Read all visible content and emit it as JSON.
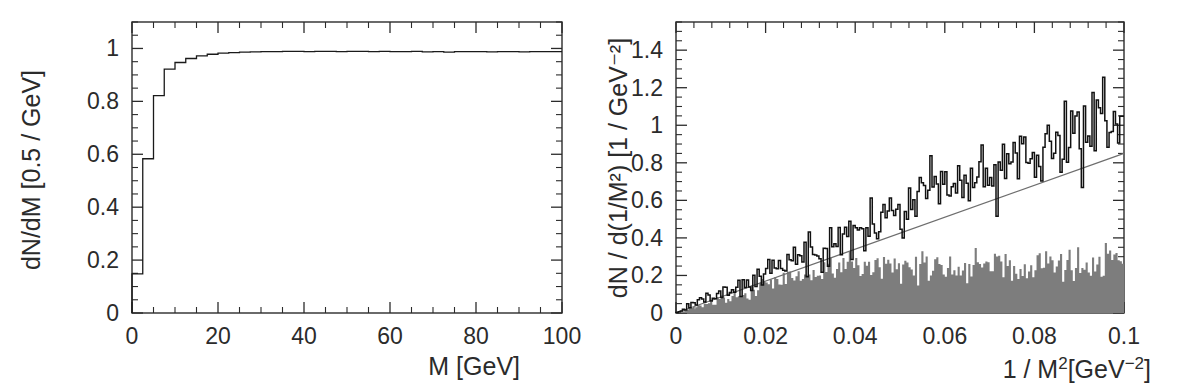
{
  "figure": {
    "panels": [
      "left",
      "right"
    ],
    "background": "#ffffff",
    "ink_color": "#2b2b2b",
    "gray_fill_color": "#7d7d7d",
    "fit_line_color": "#6e6e6e"
  },
  "chart_data": [
    {
      "panel": "left",
      "type": "line",
      "title": "",
      "xlabel": "M [GeV]",
      "ylabel": "dN/dM [0.5 / GeV]",
      "xlim": [
        0,
        100
      ],
      "ylim": [
        0,
        1.1
      ],
      "xticks": [
        0,
        20,
        40,
        60,
        80,
        100
      ],
      "xticklabels": [
        "0",
        "20",
        "40",
        "60",
        "80",
        "100"
      ],
      "yticks": [
        0,
        0.2,
        0.4,
        0.6,
        0.8,
        1
      ],
      "yticklabels": [
        "0",
        "0.2",
        "0.4",
        "0.6",
        "0.8",
        "1"
      ],
      "xminor_step": 5,
      "yminor_step": 0.05,
      "grid": false,
      "legend": "none",
      "series": [
        {
          "name": "efficiency-step-histogram",
          "style": "step",
          "bin_width": 2.5,
          "x": [
            0,
            2.5,
            5,
            7.5,
            10,
            12.5,
            15,
            17.5,
            20,
            22.5,
            25,
            27.5,
            30,
            32.5,
            35,
            37.5,
            40,
            42.5,
            45,
            47.5,
            50,
            52.5,
            55,
            57.5,
            60,
            62.5,
            65,
            67.5,
            70,
            72.5,
            75,
            77.5,
            80,
            82.5,
            85,
            87.5,
            90,
            92.5,
            95,
            97.5,
            100
          ],
          "y": [
            0.0,
            0.148,
            0.583,
            0.822,
            0.922,
            0.947,
            0.962,
            0.972,
            0.978,
            0.982,
            0.984,
            0.986,
            0.987,
            0.988,
            0.988,
            0.989,
            0.989,
            0.988,
            0.989,
            0.989,
            0.988,
            0.989,
            0.989,
            0.988,
            0.989,
            0.988,
            0.988,
            0.989,
            0.987,
            0.988,
            0.986,
            0.988,
            0.988,
            0.988,
            0.987,
            0.988,
            0.988,
            0.987,
            0.988,
            0.988,
            0.988
          ]
        }
      ]
    },
    {
      "panel": "right",
      "type": "line",
      "title": "",
      "xlabel": "1 / M²[GeV⁻²]",
      "ylabel": "dN / d(1/M²)  [1 / GeV⁻²]",
      "xlim": [
        0,
        0.1
      ],
      "ylim": [
        0,
        1.55
      ],
      "xticks": [
        0,
        0.02,
        0.04,
        0.06,
        0.08,
        0.1
      ],
      "xticklabels": [
        "0",
        "0.02",
        "0.04",
        "0.06",
        "0.08",
        "0.1"
      ],
      "yticks": [
        0,
        0.2,
        0.4,
        0.6,
        0.8,
        1,
        1.2,
        1.4
      ],
      "yticklabels": [
        "0",
        "0.2",
        "0.4",
        "0.6",
        "0.8",
        "1",
        "1.2",
        "1.4"
      ],
      "xminor_step": 0.004,
      "yminor_step": 0.05,
      "grid": false,
      "legend": "none",
      "series": [
        {
          "name": "data-histogram",
          "style": "noisy-step",
          "color": "#111111",
          "description": "noisy black histogram rising linearly from origin, amplitude of fluctuation growing with x",
          "slope": 10.7,
          "intercept": 0.0,
          "noise_amplitude_at_xmax": 0.17,
          "x_end": 0.1,
          "y_end_mean": 1.07
        },
        {
          "name": "linear-fit-line",
          "style": "straight-line",
          "color": "#6e6e6e",
          "slope": 8.5,
          "intercept": 0.0,
          "x": [
            0,
            0.1
          ],
          "y": [
            0,
            0.85
          ]
        },
        {
          "name": "background-filled-histogram",
          "style": "filled-noisy-step",
          "color": "#7d7d7d",
          "description": "gray shaded background histogram, rises linearly then plateaus near 0.25",
          "plateau_level": 0.25,
          "rise_end_x": 0.035,
          "noise_amplitude": 0.09,
          "x_end": 0.1
        }
      ]
    }
  ]
}
